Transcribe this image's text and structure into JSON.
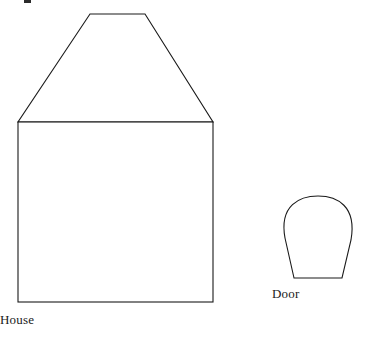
{
  "figure": {
    "background_color": "#ffffff",
    "stroke_color": "#1a1a1a",
    "stroke_width": 1.1,
    "canvas": {
      "width": 368,
      "height": 344
    }
  },
  "shapes": {
    "house": {
      "label": "House",
      "label_position": {
        "x": 120,
        "y": 322
      },
      "roof": {
        "name": "roof-trapezoid",
        "points": "90,14 145,14 213,122 18,122",
        "description": "isosceles trapezoid roof with flat ridge on top",
        "ridge_left_x": 90,
        "ridge_right_x": 145,
        "ridge_y": 14,
        "eave_left_x": 18,
        "eave_right_x": 213,
        "eave_y": 122
      },
      "body": {
        "name": "house-body-rectangle",
        "x": 18,
        "y": 122,
        "width": 195,
        "height": 180,
        "description": "square wall block below the roof"
      }
    },
    "door": {
      "label": "Door",
      "label_position": {
        "x": 322,
        "y": 296
      },
      "outline": {
        "name": "door-arch",
        "path": "M 294,278 L 285,238 C 279,205 300,196 318,196 C 337,196 357,206 351,240 L 342,278 Z",
        "description": "arched door shape: rounded top, sides tapering inward, flat bottom",
        "top_y": 196,
        "bottom_y": 278,
        "bottom_left_x": 294,
        "bottom_right_x": 342,
        "widest_left_x": 281,
        "widest_right_x": 355
      }
    }
  },
  "artifacts": {
    "top_left_mark": {
      "name": "scan-artifact",
      "description": "small clipped dark mark at the top edge",
      "x": 24,
      "y": 0,
      "width": 7,
      "height": 3
    }
  }
}
